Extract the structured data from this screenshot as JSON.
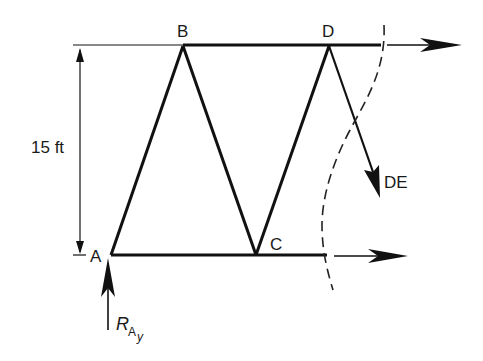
{
  "diagram": {
    "type": "truss free-body diagram (method of sections)",
    "nodes": [
      {
        "id": "A",
        "label": "A"
      },
      {
        "id": "B",
        "label": "B"
      },
      {
        "id": "C",
        "label": "C"
      },
      {
        "id": "D",
        "label": "D"
      }
    ],
    "members": [
      {
        "from": "A",
        "to": "B"
      },
      {
        "from": "B",
        "to": "C"
      },
      {
        "from": "C",
        "to": "D"
      },
      {
        "from": "B",
        "to": "D"
      },
      {
        "from": "A",
        "to": "C"
      }
    ],
    "forces": {
      "de": {
        "label": "DE"
      },
      "reaction": {
        "symbol": "R",
        "subscript": "A",
        "subsubscript": "y"
      }
    },
    "dimension": {
      "label": "15 ft"
    }
  }
}
